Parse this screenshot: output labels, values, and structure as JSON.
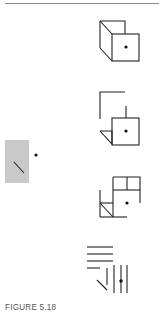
{
  "figure": {
    "caption": "FIGURE 5.18",
    "colors": {
      "rule": "#8a8a8a",
      "stroke": "#222222",
      "gray_square": "#c9c9c9",
      "caption": "#555555"
    },
    "panels": [
      {
        "id": "reference",
        "description": "gray square with diagonal line and dot"
      },
      {
        "id": "step-1",
        "description": "complete cube: back face, front face with dot, connecting edges"
      },
      {
        "id": "step-2",
        "description": "disassembled: open L bracket, front face with dot and stem, small triangle"
      },
      {
        "id": "step-3",
        "description": "rearranged: upper square, front outline with dot, lower-left box with diagonal"
      },
      {
        "id": "step-4",
        "description": "abstracted lines: horizontal stack, vertical stack with dot, diagonal"
      }
    ]
  }
}
